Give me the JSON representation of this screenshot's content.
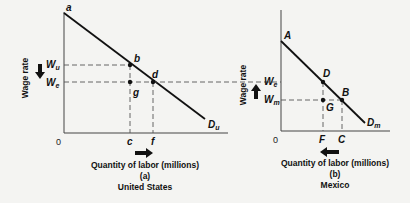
{
  "panel_a": {
    "y_axis_label": "Wage rate",
    "x_axis_label": "Quantity of labor (millions)",
    "panel_letter": "(a)",
    "country": "United States",
    "origin": "0",
    "curve_top_label": "a",
    "curve_label_main": "D",
    "curve_label_sub": "u",
    "wage_high_main": "W",
    "wage_high_sub": "u",
    "wage_eq_main": "W",
    "wage_eq_sub": "e",
    "point_b": "b",
    "point_d": "d",
    "point_g": "g",
    "tick_c": "c",
    "tick_f": "f",
    "wage_arrow": "down",
    "quantity_arrow": "right"
  },
  "panel_b": {
    "y_axis_label": "Wage rate",
    "x_axis_label": "Quantity of labor (millions)",
    "panel_letter": "(b)",
    "country": "Mexico",
    "origin": "0",
    "curve_top_label": "A",
    "curve_label_main": "D",
    "curve_label_sub": "m",
    "wage_eq_main": "W",
    "wage_eq_sub": "e",
    "wage_low_main": "W",
    "wage_low_sub": "m",
    "point_D": "D",
    "point_B": "B",
    "point_G": "G",
    "tick_F": "F",
    "tick_C": "C",
    "wage_arrow": "up",
    "quantity_arrow": "left"
  }
}
